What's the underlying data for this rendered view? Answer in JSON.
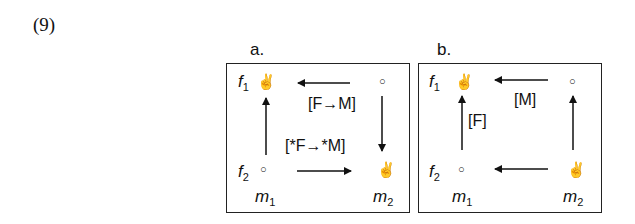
{
  "example_number": "(9)",
  "panels": [
    {
      "label": "a.",
      "row_labels": [
        {
          "base": "f",
          "sub": "1"
        },
        {
          "base": "f",
          "sub": "2"
        }
      ],
      "col_labels": [
        {
          "base": "m",
          "sub": "1"
        },
        {
          "base": "m",
          "sub": "2"
        }
      ],
      "nodes": {
        "f1m1": "victory-hand",
        "f1m2": "circle",
        "f2m1": "circle",
        "f2m2": "victory-hand"
      },
      "tags": [
        "[F→M]",
        "[*F→*M]"
      ],
      "arrows": [
        "m2-to-m1 at f1 (left)",
        "f1 to f2 at m2 (down)",
        "f2 to f1 at m1 (up)",
        "m1-to-m2 at f2 (right)"
      ]
    },
    {
      "label": "b.",
      "row_labels": [
        {
          "base": "f",
          "sub": "1"
        },
        {
          "base": "f",
          "sub": "2"
        }
      ],
      "col_labels": [
        {
          "base": "m",
          "sub": "1"
        },
        {
          "base": "m",
          "sub": "2"
        }
      ],
      "nodes": {
        "f1m1": "victory-hand",
        "f1m2": "circle",
        "f2m1": "circle",
        "f2m2": "victory-hand"
      },
      "tags": [
        "[M]",
        "[F]"
      ],
      "arrows": [
        "m2-to-m1 at f1 (left)",
        "f2 to f1 at m1 (up)",
        "f2 to f1 at m2 (up)",
        "m2-to-m1 at f2 (left)"
      ]
    }
  ],
  "symbols": {
    "victory": "✌",
    "circle": "○"
  }
}
